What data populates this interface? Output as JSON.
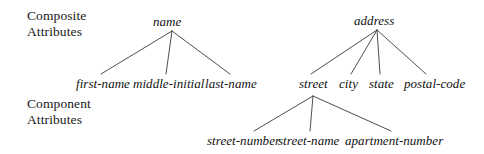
{
  "figure": {
    "type": "attribute-hierarchy-tree",
    "background_color": "#ffffff",
    "line_color": "#3a3a3a",
    "text_color": "#111111"
  },
  "annotations": {
    "composite": {
      "line1": "Composite",
      "line2": "Attributes"
    },
    "component": {
      "line1": "Component",
      "line2": "Attributes"
    }
  },
  "trees": [
    {
      "root": "name",
      "children": [
        "first-name",
        "middle-initial",
        "last-name"
      ]
    },
    {
      "root": "address",
      "children": [
        "street",
        "city",
        "state",
        "postal-code"
      ],
      "subtree": {
        "root": "street",
        "children": [
          "street-number",
          "street-name",
          "apartment-number"
        ]
      }
    }
  ],
  "nodes": {
    "name": "name",
    "first_name": "first-name",
    "middle_initial": "middle-initial",
    "last_name": "last-name",
    "address": "address",
    "street": "street",
    "city": "city",
    "state": "state",
    "postal_code": "postal-code",
    "street_number": "street-number",
    "street_name": "street-name",
    "apartment_number": "apartment-number"
  }
}
